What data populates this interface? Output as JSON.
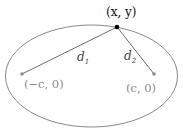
{
  "diagram": {
    "point": {
      "label": "(x, y)",
      "x": 117,
      "y": 27
    },
    "foci": [
      {
        "label": "(−c, 0)",
        "x": 22,
        "y": 74
      },
      {
        "label": "(c, 0)",
        "x": 154,
        "y": 74
      }
    ],
    "distances": [
      {
        "label": "d",
        "sub": "1"
      },
      {
        "label": "d",
        "sub": "2"
      }
    ],
    "ellipse": {
      "cx": 91.5,
      "cy": 76,
      "rx": 86,
      "ry": 51
    },
    "colors": {
      "ellipse": "#8a8a8a",
      "line": "#6e6e6e",
      "focus_text": "#8c8c8c",
      "point": "#000000",
      "text": "#222222"
    }
  }
}
